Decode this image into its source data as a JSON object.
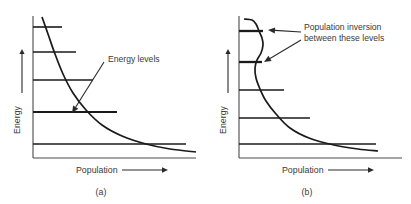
{
  "figure": {
    "background_color": "#ffffff",
    "line_color": "#1a1a1a",
    "axis_color": "#4a4a4a",
    "text_color": "#3a3a3a"
  },
  "chart_data": {
    "type": "line",
    "title": "",
    "panels": [
      {
        "id": "a",
        "caption": "(a)",
        "xlabel": "Population",
        "ylabel": "Energy",
        "annotation": "Energy levels",
        "description": "Thermal equilibrium Boltzmann distribution: population decreases monotonically with increasing energy",
        "axis": {
          "x_origin": 33,
          "y_bottom": 158,
          "x_right": 196,
          "y_top": 16
        },
        "levels": [
          {
            "index": 5,
            "y": 27,
            "x_end": 62,
            "width": 1.6
          },
          {
            "index": 4,
            "y": 52,
            "x_end": 76,
            "width": 1.6
          },
          {
            "index": 3,
            "y": 80,
            "x_end": 93,
            "width": 1.6
          },
          {
            "index": 2,
            "y": 112,
            "x_end": 117,
            "width": 1.9
          },
          {
            "index": 1,
            "y": 144,
            "x_end": 186,
            "width": 1.6
          }
        ],
        "curve_points": [
          [
            42,
            17
          ],
          [
            48,
            34
          ],
          [
            55,
            54
          ],
          [
            63,
            74
          ],
          [
            73,
            93
          ],
          [
            86,
            110
          ],
          [
            102,
            125
          ],
          [
            122,
            136
          ],
          [
            146,
            144
          ],
          [
            170,
            149
          ],
          [
            196,
            152
          ]
        ],
        "annotation_arrow": {
          "from": [
            104,
            62
          ],
          "to": [
            72,
            113
          ]
        },
        "annotation_text_pos": [
          108,
          62
        ],
        "xlabel_pos": [
          76,
          173
        ],
        "xlabel_arrow": {
          "from": [
            122,
            170
          ],
          "to": [
            168,
            170
          ]
        },
        "ylabel_pos": [
          20,
          120
        ],
        "ylabel_arrow": {
          "from": [
            22,
            93
          ],
          "to": [
            22,
            49
          ]
        },
        "caption_pos": [
          101,
          195
        ]
      },
      {
        "id": "b",
        "caption": "(b)",
        "xlabel": "Population",
        "ylabel": "Energy",
        "annotation": "Population inversion\nbetween these levels",
        "annotation_line_1": "Population inversion",
        "annotation_line_2": "between these levels",
        "description": "Population inversion: upper level has greater population than the level below it, producing a bulge in the distribution curve",
        "axis": {
          "x_origin": 33,
          "y_bottom": 158,
          "x_right": 196,
          "y_top": 16
        },
        "levels": [
          {
            "index": 5,
            "y": 31,
            "x_end": 57,
            "width": 2.3
          },
          {
            "index": 4,
            "y": 62,
            "x_end": 56,
            "width": 2.3
          },
          {
            "index": 3,
            "y": 90,
            "x_end": 78,
            "width": 1.6
          },
          {
            "index": 2,
            "y": 118,
            "x_end": 104,
            "width": 1.6
          },
          {
            "index": 1,
            "y": 144,
            "x_end": 170,
            "width": 1.6
          }
        ],
        "curve_points": [
          [
            38,
            19
          ],
          [
            46,
            20
          ],
          [
            50,
            24
          ],
          [
            53,
            31
          ],
          [
            56,
            38
          ],
          [
            57,
            45
          ],
          [
            55,
            53
          ],
          [
            51,
            60
          ],
          [
            49,
            68
          ],
          [
            50,
            78
          ],
          [
            54,
            89
          ],
          [
            60,
            101
          ],
          [
            70,
            114
          ],
          [
            84,
            128
          ],
          [
            103,
            138
          ],
          [
            128,
            145
          ],
          [
            152,
            149
          ],
          [
            172,
            151
          ]
        ],
        "annotation_arrow_upper": {
          "from": [
            95,
            32
          ],
          "to": [
            62,
            30
          ]
        },
        "annotation_arrow_lower": {
          "from": [
            95,
            40
          ],
          "to": [
            58,
            62
          ]
        },
        "annotation_text_pos": [
          98,
          30
        ],
        "xlabel_pos": [
          76,
          173
        ],
        "xlabel_arrow": {
          "from": [
            122,
            170
          ],
          "to": [
            168,
            170
          ]
        },
        "ylabel_pos": [
          20,
          120
        ],
        "ylabel_arrow": {
          "from": [
            22,
            93
          ],
          "to": [
            22,
            49
          ]
        },
        "caption_pos": [
          101,
          195
        ]
      }
    ]
  }
}
